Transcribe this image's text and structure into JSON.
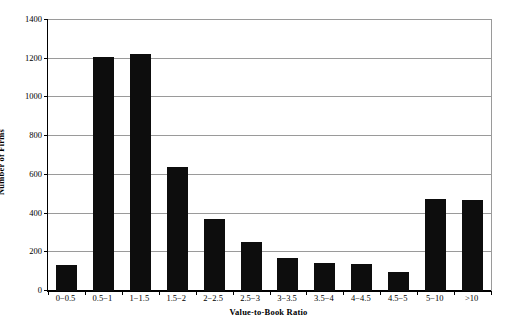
{
  "chart_data": {
    "type": "bar",
    "title": "",
    "xlabel": "Value-to-Book Ratio",
    "ylabel": "Number of Firms",
    "categories": [
      "0−0.5",
      "0.5−1",
      "1−1.5",
      "1.5−2",
      "2−2.5",
      "2.5−3",
      "3−3.5",
      "3.5−4",
      "4−4.5",
      "4.5−5",
      "5−10",
      ">10"
    ],
    "values": [
      135,
      1210,
      1225,
      640,
      370,
      255,
      170,
      145,
      140,
      100,
      475,
      470
    ],
    "ylim": [
      0,
      1400
    ],
    "ytick_values": [
      0,
      200,
      400,
      600,
      800,
      1000,
      1200,
      1400
    ],
    "ytick_labels": [
      "0",
      "200",
      "400",
      "600",
      "800",
      "1000",
      "1200",
      "1400"
    ],
    "grid": "horizontal",
    "legend": "none",
    "bar_color": "#0d0d0d",
    "axis_color": "#000000",
    "gridline_color": "#9a9a9a"
  }
}
